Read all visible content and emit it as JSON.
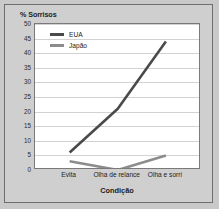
{
  "chart_data": {
    "type": "line",
    "title": "",
    "ylabel": "% Sorrisos",
    "xlabel": "Condição",
    "categories": [
      "Evita",
      "Olha de relance",
      "Olha e sorri"
    ],
    "series": [
      {
        "name": "EUA",
        "values": [
          6,
          21,
          44
        ],
        "color": "#4a4a4a"
      },
      {
        "name": "Japão",
        "values": [
          3,
          0,
          5
        ],
        "color": "#8c8c8c"
      }
    ],
    "ylim": [
      0,
      50
    ],
    "yticks": [
      0,
      5,
      10,
      15,
      20,
      25,
      30,
      35,
      40,
      45,
      50
    ],
    "ytick_labels": [
      "0",
      "5",
      "10",
      "15",
      "20",
      "25",
      "30",
      "35",
      "40",
      "45",
      "50"
    ],
    "grid": true,
    "legend_position": "top-left"
  },
  "colors": {
    "figure_background": "#cfcfcf",
    "plot_background": "#ffffff",
    "gridline": "#d2d2d2",
    "axis": "#7a7a7a",
    "text": "#1c1c1c"
  }
}
